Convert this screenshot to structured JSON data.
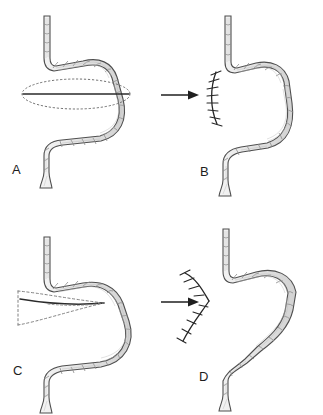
{
  "figure": {
    "type": "medical-illustration",
    "background_color": "#ffffff",
    "panel_count": 4,
    "layout": "2x2 grid"
  },
  "palette": {
    "bowel_fill": "#e6e6e6",
    "bowel_fill_light": "#f0f0f0",
    "bowel_outline": "#4f4f4f",
    "bowel_outline_dark": "#3a3a3a",
    "haustra_line": "#8c8c8c",
    "texture_line": "#b4b4b4",
    "incision_line": "#2b2b2b",
    "dashed_guide": "#7a7a7a",
    "suture_line": "#262626",
    "arrow_color": "#1f1f1f",
    "label_color": "#1d1d1d"
  },
  "panels": [
    {
      "id": "a",
      "label": "A",
      "caption": "Longitudinal enterotomy marked by dashed elliptical outline over strictured segment",
      "marking": {
        "kind": "ellipse-incision",
        "outline_style": "dotted",
        "center_line_style": "solid",
        "orientation": "horizontal"
      }
    },
    {
      "id": "b",
      "label": "B",
      "caption": "Transverse closure completed with interrupted sutures along vertical suture line",
      "marking": {
        "kind": "suture-line",
        "shape": "vertical-arc",
        "stitch_style": "interrupted",
        "stitch_count": 9
      }
    },
    {
      "id": "c",
      "label": "C",
      "caption": "Wedge-shaped incision with dashed guide lines converging to apex",
      "marking": {
        "kind": "wedge-incision",
        "outline_style": "dashed",
        "center_line_style": "solid",
        "apex_side": "right"
      }
    },
    {
      "id": "d",
      "label": "D",
      "caption": "S-shaped suture line after closure of the wedge defect",
      "marking": {
        "kind": "suture-line",
        "shape": "s-curve",
        "stitch_style": "interrupted",
        "stitch_count": 10
      }
    }
  ],
  "arrows": [
    {
      "id": "arrow-a-b",
      "from_panel": "A",
      "to_panel": "B",
      "direction": "right",
      "head": "solid-triangle"
    },
    {
      "id": "arrow-c-d",
      "from_panel": "C",
      "to_panel": "D",
      "direction": "right",
      "head": "solid-triangle"
    }
  ]
}
